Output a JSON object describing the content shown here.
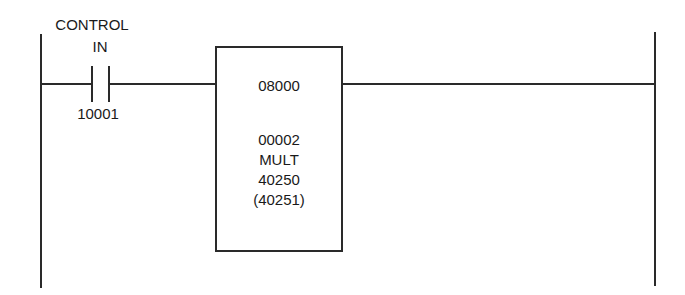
{
  "diagram": {
    "type": "ladder_logic_rung",
    "contact": {
      "label_line1": "CONTROL",
      "label_line2": "IN",
      "address": "10001",
      "type": "normally-open"
    },
    "function_block": {
      "top_register": "08000",
      "middle_register": "00002",
      "operation": "MULT",
      "result_register": "40250",
      "result_register_continued": "(40251)"
    },
    "colors": {
      "line": "#2a2a2a",
      "background": "#ffffff"
    }
  }
}
